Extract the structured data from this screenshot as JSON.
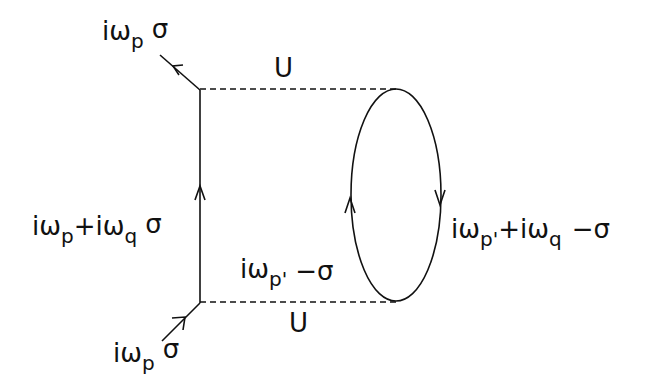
{
  "diagram": {
    "type": "feynman-diagram",
    "interaction_top": {
      "label": "U"
    },
    "interaction_bottom": {
      "label": "U"
    },
    "outgoing_leg": {
      "main": "iω",
      "sub": "p",
      "spin": "σ"
    },
    "incoming_leg": {
      "main": "iω",
      "sub": "p",
      "spin": "σ"
    },
    "internal_propagator": {
      "main1": "iω",
      "sub1": "p",
      "plus": "+iω",
      "sub2": "q",
      "spin": "σ"
    },
    "loop_left": {
      "main": "iω",
      "sub": "p'",
      "spin": "−σ"
    },
    "loop_right": {
      "main1": "iω",
      "sub1": "p'",
      "plus": "+iω",
      "sub2": "q",
      "spin": "−σ"
    },
    "colors": {
      "line": "#111111",
      "background": "#ffffff"
    }
  }
}
